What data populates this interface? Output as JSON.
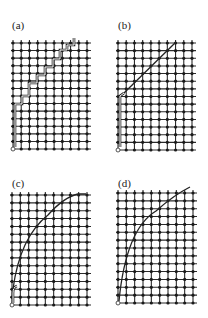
{
  "figure": {
    "grid": {
      "columns": 10,
      "rows": 15,
      "line_color": "#2a2a2a",
      "node_color": "#1a1a1a"
    },
    "panels": [
      {
        "id": "a",
        "label": "(a)",
        "description": "staircase double-line path from origin to top",
        "path_type": "staircase"
      },
      {
        "id": "b",
        "label": "(b)",
        "description": "vertical double-line segment then straight diagonal to top",
        "path_type": "line"
      },
      {
        "id": "c",
        "label": "(c)",
        "description": "curve rising from origin with small hook, bending to top",
        "path_type": "curve"
      },
      {
        "id": "d",
        "label": "(d)",
        "description": "smooth concave curve from origin to top-right",
        "path_type": "curve"
      }
    ]
  }
}
